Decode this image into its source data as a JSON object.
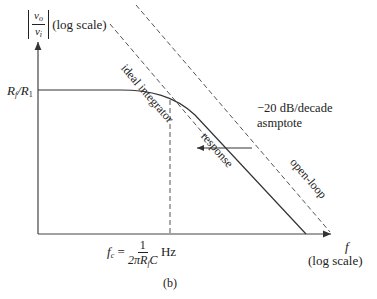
{
  "figure": {
    "caption": "(b)",
    "y_axis": {
      "label_numerator": "v",
      "label_numerator_sub": "o",
      "label_denominator": "v",
      "label_denominator_sub": "i",
      "scale_note": "(log scale)",
      "level_label_main": "R",
      "level_label_sub1": "f",
      "level_label_slash": "/R",
      "level_label_sub2": "1"
    },
    "x_axis": {
      "label": "f",
      "scale_note": "(log scale)",
      "corner_freq": {
        "lhs": "f",
        "lhs_sub": "c",
        "equals": "=",
        "numerator": "1",
        "denominator_prefix": "2πR",
        "denominator_sub": "f",
        "denominator_suffix": "C",
        "unit": "Hz"
      }
    },
    "curves": {
      "ideal_integrator_label": "ideal integrator",
      "response_label": "response",
      "open_loop_label": "open-loop"
    },
    "annotation": {
      "line1": "−20 dB/decade",
      "line2": "asmptote"
    },
    "colors": {
      "line": "#333333",
      "dashed": "#555555",
      "background": "#ffffff"
    }
  }
}
